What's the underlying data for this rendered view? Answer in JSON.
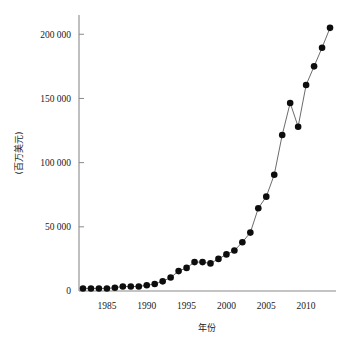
{
  "chart_data": {
    "type": "line",
    "title": "",
    "subtitle": "",
    "xlabel": "年份",
    "ylabel": "(百万美元)",
    "xlim": [
      1981.5,
      2013.5
    ],
    "ylim": [
      0,
      215000
    ],
    "grid": false,
    "legend": null,
    "legend_position": "none",
    "markers": "filled-circle",
    "x_ticks": [
      1985,
      1990,
      1995,
      2000,
      2005,
      2010
    ],
    "x_tick_labels": [
      "1985",
      "1990",
      "1995",
      "2000",
      "2005",
      "2010"
    ],
    "y_ticks": [
      0,
      50000,
      100000,
      150000,
      200000
    ],
    "y_tick_labels": [
      "0",
      "50 000",
      "100 000",
      "150 000",
      "200 000"
    ],
    "x": [
      1982,
      1983,
      1984,
      1985,
      1986,
      1987,
      1988,
      1989,
      1990,
      1991,
      1992,
      1993,
      1994,
      1995,
      1996,
      1997,
      1998,
      1999,
      2000,
      2001,
      2002,
      2003,
      2004,
      2005,
      2006,
      2007,
      2008,
      2009,
      2010,
      2011,
      2012,
      2013
    ],
    "values": [
      2000,
      2000,
      2000,
      2000,
      2500,
      3500,
      3500,
      3500,
      4500,
      5500,
      7500,
      10500,
      15500,
      18000,
      22500,
      22500,
      21500,
      25000,
      28500,
      31500,
      38000,
      45500,
      64500,
      73500,
      90500,
      121500,
      146500,
      128000,
      160500,
      175000,
      189500,
      205000
    ],
    "series": [
      {
        "name": "value",
        "values": [
          2000,
          2000,
          2000,
          2000,
          2500,
          3500,
          3500,
          3500,
          4500,
          5500,
          7500,
          10500,
          15500,
          18000,
          22500,
          22500,
          21500,
          25000,
          28500,
          31500,
          38000,
          45500,
          64500,
          73500,
          90500,
          121500,
          146500,
          128000,
          160500,
          175000,
          189500,
          205000
        ]
      }
    ],
    "colors": {
      "marker": "#0d0d0d",
      "line": "#5a5a5a",
      "axis": "#8a8a8a",
      "text": "#1a1a1a",
      "background": "#ffffff"
    }
  }
}
